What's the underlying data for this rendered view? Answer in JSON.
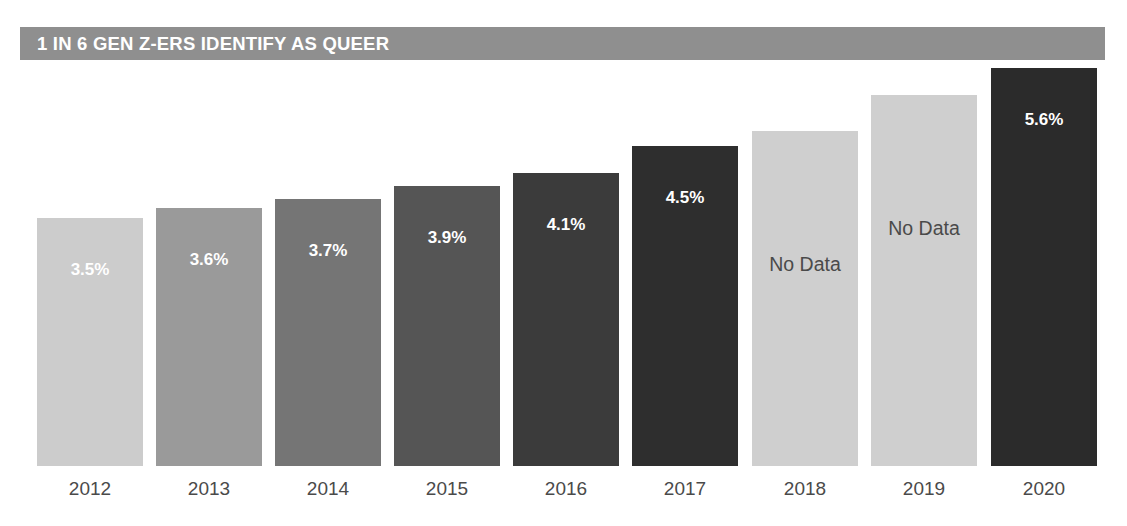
{
  "title": "1 IN 6 GEN Z-ERS IDENTIFY AS QUEER",
  "colors": {
    "banner": "#8f8f8f",
    "banner_text": "#ffffff",
    "axis_label": "#4a4a4a",
    "value_light_text": "#ffffff",
    "value_dark_text": "#4a4a4a",
    "background": "#ffffff"
  },
  "chart_data": {
    "type": "bar",
    "title": "1 IN 6 GEN Z-ERS IDENTIFY AS QUEER",
    "xlabel": "",
    "ylabel": "",
    "grid": false,
    "legend": "none",
    "ylim": [
      0,
      6.2
    ],
    "categories": [
      "2012",
      "2013",
      "2014",
      "2015",
      "2016",
      "2017",
      "2018",
      "2019",
      "2020"
    ],
    "values": [
      3.5,
      3.6,
      3.7,
      3.9,
      4.1,
      4.5,
      null,
      null,
      5.6
    ],
    "bars": [
      {
        "category": "2012",
        "value": 3.5,
        "label": "3.5%",
        "color": "#cccccc",
        "label_color": "#ffffff",
        "has_data": true,
        "x": 37,
        "width": 106,
        "top": 218
      },
      {
        "category": "2013",
        "value": 3.6,
        "label": "3.6%",
        "color": "#9a9a9a",
        "label_color": "#ffffff",
        "has_data": true,
        "x": 156,
        "width": 106,
        "top": 208
      },
      {
        "category": "2014",
        "value": 3.7,
        "label": "3.7%",
        "color": "#757575",
        "label_color": "#ffffff",
        "has_data": true,
        "x": 275,
        "width": 106,
        "top": 199
      },
      {
        "category": "2015",
        "value": 3.9,
        "label": "3.9%",
        "color": "#555555",
        "label_color": "#ffffff",
        "has_data": true,
        "x": 394,
        "width": 106,
        "top": 186
      },
      {
        "category": "2016",
        "value": 4.1,
        "label": "4.1%",
        "color": "#3b3b3b",
        "label_color": "#ffffff",
        "has_data": true,
        "x": 513,
        "width": 106,
        "top": 173
      },
      {
        "category": "2017",
        "value": 4.5,
        "label": "4.5%",
        "color": "#2e2e2e",
        "label_color": "#ffffff",
        "has_data": true,
        "x": 632,
        "width": 106,
        "top": 146
      },
      {
        "category": "2018",
        "value": null,
        "label": "No Data",
        "color": "#cfcfcf",
        "label_color": "#4a4a4a",
        "has_data": false,
        "x": 752,
        "width": 106,
        "top": 131
      },
      {
        "category": "2019",
        "value": null,
        "label": "No Data",
        "color": "#cfcfcf",
        "label_color": "#4a4a4a",
        "has_data": false,
        "x": 871,
        "width": 106,
        "top": 95
      },
      {
        "category": "2020",
        "value": 5.6,
        "label": "5.6%",
        "color": "#2b2b2b",
        "label_color": "#ffffff",
        "has_data": true,
        "x": 991,
        "width": 106,
        "top": 68
      }
    ]
  }
}
